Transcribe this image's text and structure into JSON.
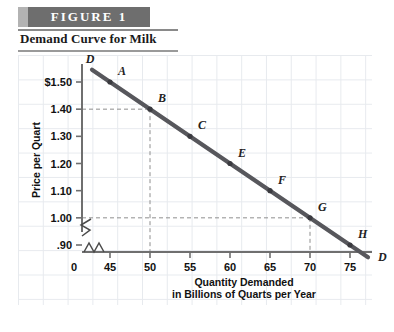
{
  "figure": {
    "banner_label": "FIGURE  1",
    "subtitle": "Demand Curve for Milk"
  },
  "axes": {
    "y_title": "Price per Quart",
    "x_title_line1": "Quantity Demanded",
    "x_title_line2": "in Billions of Quarts per Year",
    "y_ticks": [
      "$1.50",
      "1.40",
      "1.30",
      "1.20",
      "1.10",
      "1.00",
      ".90"
    ],
    "x_ticks": [
      "45",
      "50",
      "55",
      "60",
      "65",
      "70",
      "75"
    ],
    "origin_label": "0",
    "y_values": [
      1.5,
      1.4,
      1.3,
      1.2,
      1.1,
      1.0,
      0.9
    ],
    "x_values": [
      45,
      50,
      55,
      60,
      65,
      70,
      75
    ],
    "break_symbol": "zigzag"
  },
  "chart_data": {
    "type": "line",
    "title": "Demand Curve for Milk",
    "xlabel": "Quantity Demanded in Billions of Quarts per Year",
    "ylabel": "Price per Quart",
    "xlim": [
      42,
      79
    ],
    "ylim": [
      0.85,
      1.56
    ],
    "grid": true,
    "legend": "none",
    "curve_label": "D",
    "series": [
      {
        "name": "D",
        "points": [
          {
            "label": "A",
            "x": 45,
            "y": 1.5
          },
          {
            "label": "B",
            "x": 50,
            "y": 1.4
          },
          {
            "label": "C",
            "x": 55,
            "y": 1.3
          },
          {
            "label": "E",
            "x": 60,
            "y": 1.2
          },
          {
            "label": "F",
            "x": 65,
            "y": 1.1
          },
          {
            "label": "G",
            "x": 70,
            "y": 1.0
          },
          {
            "label": "H",
            "x": 75,
            "y": 0.9
          }
        ]
      }
    ],
    "annotations": [
      {
        "text": "D",
        "position": "curve-start-upper-left"
      },
      {
        "text": "D",
        "position": "curve-end-lower-right"
      }
    ],
    "guide_lines": [
      {
        "from_point": "B",
        "x": 50,
        "y": 1.4
      },
      {
        "from_point": "G",
        "x": 70,
        "y": 1.0
      }
    ]
  },
  "colors": {
    "banner_bg": "#6e6e6e",
    "banner_edge": "#b3b3b3",
    "curve": "#57575c",
    "axis": "#6f6f6f",
    "grid": "#e7eaee",
    "text": "#111111"
  }
}
